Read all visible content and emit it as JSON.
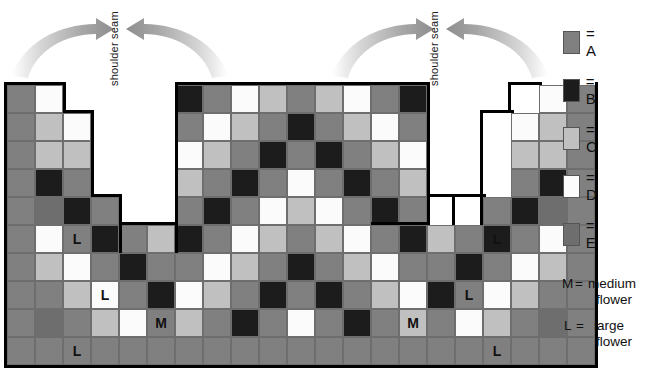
{
  "diagram": {
    "grid": {
      "columns": 19,
      "rows": 10,
      "cell_size_px": 28
    },
    "seam_labels": [
      {
        "text": "shoulder seam",
        "side": "left"
      },
      {
        "text": "shoulder seam",
        "side": "right"
      }
    ],
    "colors": {
      "A": "#808080",
      "B": "#1c1c1c",
      "C": "#c0c0c0",
      "D": "#fbfbfb",
      "E": "#6e6e6e",
      "grid_line": "#6e6e6e",
      "outline": "#000000",
      "arrow": "#9a9a9a"
    },
    "legend": {
      "items": [
        {
          "key": "A",
          "label": "= A",
          "color": "#808080"
        },
        {
          "key": "B",
          "label": "= B",
          "color": "#1c1c1c"
        },
        {
          "key": "C",
          "label": "= C",
          "color": "#c0c0c0"
        },
        {
          "key": "D",
          "label": "= D",
          "color": "#fbfbfb"
        },
        {
          "key": "E",
          "label": "= E",
          "color": "#6e6e6e"
        }
      ],
      "notes": [
        {
          "key": "M",
          "eq": "=",
          "word1": "medium",
          "word2": "flower"
        },
        {
          "key": "L",
          "eq": "=",
          "word1": "large",
          "word2": "flower"
        }
      ]
    },
    "markers": {
      "M": "M",
      "L": "L"
    },
    "chart_rows": [
      [
        "A",
        "D",
        null,
        null,
        null,
        null,
        "B",
        "A",
        "D",
        "C",
        "A",
        "C",
        "D",
        "A",
        "B",
        null,
        null,
        null,
        null,
        "D",
        "A"
      ],
      [
        "A",
        "C",
        "D",
        null,
        null,
        null,
        "A",
        "D",
        "C",
        "A",
        "B",
        "A",
        "C",
        "D",
        "A",
        null,
        null,
        null,
        "D",
        "C",
        "A"
      ],
      [
        "A",
        "C",
        "C",
        null,
        null,
        null,
        "D",
        "C",
        "A",
        "B",
        "A",
        "B",
        "A",
        "C",
        "D",
        null,
        null,
        null,
        "C",
        "C",
        "A"
      ],
      [
        "A",
        "B",
        "A",
        null,
        null,
        null,
        "C",
        "A",
        "B",
        "A",
        "D",
        "A",
        "B",
        "A",
        "C",
        null,
        null,
        null,
        "A",
        "B",
        "A"
      ],
      [
        "A",
        "E",
        "B",
        "A",
        null,
        null,
        "A",
        "B",
        "A",
        "D",
        "C",
        "D",
        "A",
        "B",
        "A",
        null,
        null,
        "A",
        "B",
        "E",
        "A"
      ],
      [
        "A",
        "D",
        "A",
        "B",
        "A",
        "C",
        "B",
        "A",
        "D",
        "C",
        "A",
        "C",
        "D",
        "A",
        "B",
        "C",
        "A",
        "B",
        "A",
        "D",
        "A"
      ],
      [
        "A",
        "C",
        "D",
        "A",
        "B",
        "A",
        "A",
        "D",
        "C",
        "A",
        "B",
        "A",
        "C",
        "D",
        "A",
        "A",
        "B",
        "A",
        "D",
        "C",
        "A"
      ],
      [
        "A",
        "A",
        "C",
        "D",
        "A",
        "B",
        "D",
        "C",
        "A",
        "B",
        "A",
        "B",
        "A",
        "C",
        "D",
        "B",
        "A",
        "D",
        "C",
        "A",
        "A"
      ],
      [
        "A",
        "E",
        "A",
        "C",
        "D",
        "A",
        "C",
        "A",
        "B",
        "A",
        "D",
        "A",
        "B",
        "A",
        "C",
        "A",
        "D",
        "C",
        "A",
        "E",
        "A"
      ],
      [
        "A",
        "A",
        "A",
        "A",
        "A",
        "A",
        "A",
        "A",
        "A",
        "A",
        "A",
        "A",
        "A",
        "A",
        "A",
        "A",
        "A",
        "A",
        "A",
        "A",
        "A"
      ]
    ],
    "marker_cells": [
      {
        "row": 5,
        "col": 2,
        "text": "L"
      },
      {
        "row": 7,
        "col": 3,
        "text": "L"
      },
      {
        "row": 8,
        "col": 5,
        "text": "M"
      },
      {
        "row": 9,
        "col": 2,
        "text": "L"
      },
      {
        "row": 5,
        "col": 17,
        "text": "L"
      },
      {
        "row": 7,
        "col": 16,
        "text": "L"
      },
      {
        "row": 8,
        "col": 14,
        "text": "M"
      },
      {
        "row": 9,
        "col": 17,
        "text": "L"
      }
    ]
  }
}
